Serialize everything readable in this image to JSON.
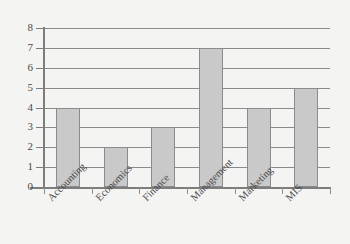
{
  "chart_data": {
    "type": "bar",
    "title": "",
    "subtitle": "",
    "xlabel": "",
    "ylabel": "",
    "categories": [
      "Accounting",
      "Economics",
      "Finance",
      "Management",
      "Marketing",
      "MIS"
    ],
    "values": [
      4,
      2,
      3,
      7,
      4,
      5
    ],
    "ylim": [
      0,
      8
    ],
    "ytick_labels": [
      "0",
      "1",
      "2",
      "3",
      "4",
      "5",
      "6",
      "7",
      "8"
    ],
    "ytick_values": [
      0,
      1,
      2,
      3,
      4,
      5,
      6,
      7,
      8
    ],
    "grid": true,
    "grid_axis": "y",
    "legend": false,
    "legend_position": "none",
    "annotations": [],
    "bar_fill_color": "#c9c9c9",
    "bar_edge_color": "#8b8b8b",
    "grid_color": "#8a8a8a",
    "axis_color": "#7d7d7d",
    "background_color": "#f4f4f2",
    "text_color": "#4a4a4a",
    "xtick_label_rotation": -45
  }
}
